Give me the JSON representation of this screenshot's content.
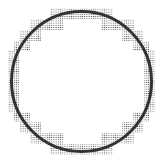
{
  "diagram": {
    "title": "",
    "circle": {
      "cx": 81.5,
      "cy": 81.5,
      "r": 70,
      "stroke": "#333333",
      "stroke_width": 3
    },
    "stipple": {
      "dot_color": "#555555",
      "dot_spacing": 2.2,
      "dot_radius": 0.55
    },
    "cells": [
      {
        "x": 50,
        "y": 8,
        "w": 63,
        "h": 11
      },
      {
        "x": 30,
        "y": 19,
        "w": 33,
        "h": 11
      },
      {
        "x": 101,
        "y": 19,
        "w": 33,
        "h": 11
      },
      {
        "x": 20,
        "y": 30,
        "w": 21,
        "h": 11
      },
      {
        "x": 122,
        "y": 30,
        "w": 21,
        "h": 11
      },
      {
        "x": 14,
        "y": 41,
        "w": 16,
        "h": 10
      },
      {
        "x": 133,
        "y": 41,
        "w": 16,
        "h": 10
      },
      {
        "x": 8,
        "y": 50,
        "w": 11,
        "h": 63
      },
      {
        "x": 144,
        "y": 50,
        "w": 11,
        "h": 63
      },
      {
        "x": 14,
        "y": 112,
        "w": 16,
        "h": 10
      },
      {
        "x": 133,
        "y": 112,
        "w": 16,
        "h": 10
      },
      {
        "x": 20,
        "y": 122,
        "w": 21,
        "h": 11
      },
      {
        "x": 122,
        "y": 122,
        "w": 21,
        "h": 11
      },
      {
        "x": 30,
        "y": 133,
        "w": 33,
        "h": 11
      },
      {
        "x": 101,
        "y": 133,
        "w": 33,
        "h": 11
      },
      {
        "x": 50,
        "y": 144,
        "w": 63,
        "h": 11
      }
    ]
  }
}
